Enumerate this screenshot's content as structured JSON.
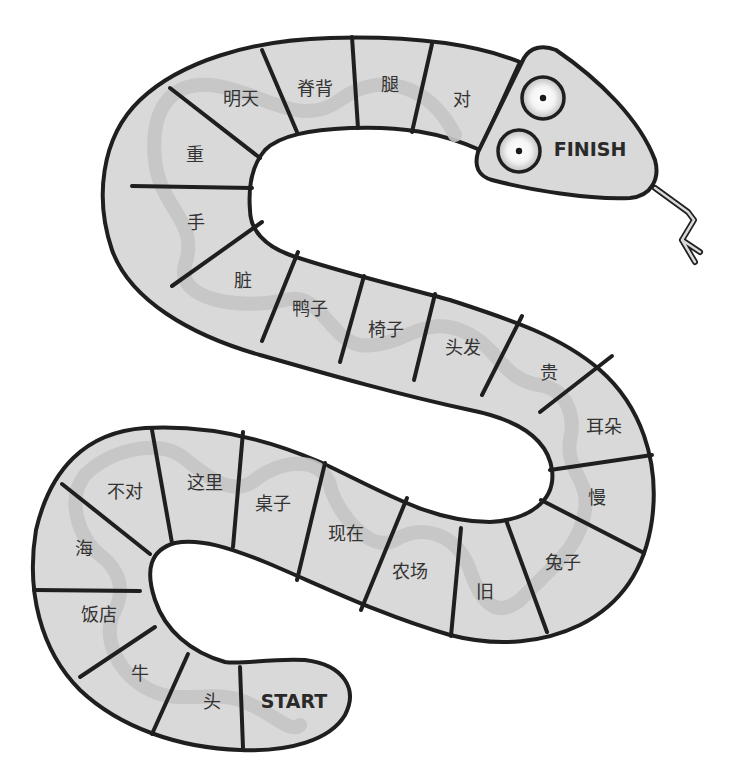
{
  "board": {
    "title": "Snake board game",
    "start_label": "START",
    "finish_label": "FINISH",
    "colors": {
      "body": "#d9d9d9",
      "outline": "#1f1f1f",
      "ribbon": "#c4c4c4",
      "text": "#333333"
    },
    "cells": [
      {
        "index": 0,
        "label": "START"
      },
      {
        "index": 1,
        "label": "头"
      },
      {
        "index": 2,
        "label": "牛"
      },
      {
        "index": 3,
        "label": "饭店"
      },
      {
        "index": 4,
        "label": "海"
      },
      {
        "index": 5,
        "label": "不对"
      },
      {
        "index": 6,
        "label": "这里"
      },
      {
        "index": 7,
        "label": "桌子"
      },
      {
        "index": 8,
        "label": "现在"
      },
      {
        "index": 9,
        "label": "农场"
      },
      {
        "index": 10,
        "label": "旧"
      },
      {
        "index": 11,
        "label": "兔子"
      },
      {
        "index": 12,
        "label": "慢"
      },
      {
        "index": 13,
        "label": "耳朵"
      },
      {
        "index": 14,
        "label": "贵"
      },
      {
        "index": 15,
        "label": "头发"
      },
      {
        "index": 16,
        "label": "椅子"
      },
      {
        "index": 17,
        "label": "鸭子"
      },
      {
        "index": 18,
        "label": "脏"
      },
      {
        "index": 19,
        "label": "手"
      },
      {
        "index": 20,
        "label": "重"
      },
      {
        "index": 21,
        "label": "明天"
      },
      {
        "index": 22,
        "label": "脊背"
      },
      {
        "index": 23,
        "label": "腿"
      },
      {
        "index": 24,
        "label": "对"
      },
      {
        "index": 25,
        "label": "FINISH"
      }
    ]
  }
}
